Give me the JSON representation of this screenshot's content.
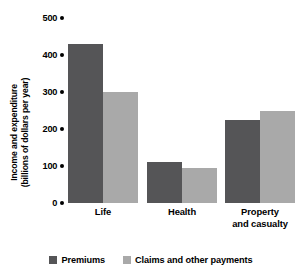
{
  "chart_data": {
    "type": "bar",
    "title": "",
    "xlabel": "",
    "ylabel": "Income and expenditure\n(billions of dollars per year)",
    "categories": [
      "Life",
      "Health",
      "Property\nand casualty"
    ],
    "series": [
      {
        "name": "Premiums",
        "color": "#555557",
        "values": [
          430,
          110,
          225
        ]
      },
      {
        "name": "Claims and other payments",
        "color": "#a9a9a9",
        "values": [
          300,
          95,
          250
        ]
      }
    ],
    "ylim": [
      0,
      500
    ],
    "yticks": [
      500,
      400,
      300,
      200,
      100,
      0
    ],
    "ytick_labels": [
      "500",
      "400",
      "300",
      "200",
      "100",
      "0"
    ],
    "grid": false,
    "legend_position": "bottom"
  },
  "legend": {
    "items": [
      {
        "label": "Premiums",
        "color": "#555557"
      },
      {
        "label": "Claims and other payments",
        "color": "#a9a9a9"
      }
    ]
  },
  "colors": {
    "premiums": "#555557",
    "claims": "#a9a9a9",
    "axis": "#000000",
    "background": "#ffffff"
  }
}
